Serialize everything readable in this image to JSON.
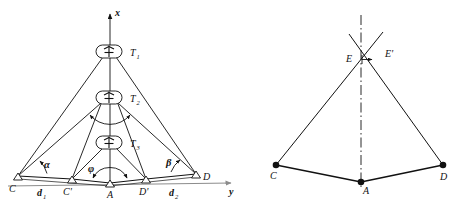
{
  "figure": {
    "colors": {
      "stroke": "#111111",
      "axis_gray": "#8c8c8c",
      "background": "#ffffff"
    }
  },
  "left_panel": {
    "axes": {
      "x_label": "x",
      "y_label": "y",
      "x_axis_color": "#111111",
      "y_axis_color": "#8c8c8c"
    },
    "stations": [
      {
        "id": "T1",
        "label": "T",
        "sub": "1",
        "icon": "antenna-tower-icon",
        "x": 108,
        "y": 52
      },
      {
        "id": "T2",
        "label": "T",
        "sub": "2",
        "icon": "antenna-tower-icon",
        "x": 108,
        "y": 98
      },
      {
        "id": "T3",
        "label": "T",
        "sub": "3",
        "icon": "antenna-tower-icon",
        "x": 108,
        "y": 143
      }
    ],
    "ground_points": [
      {
        "id": "C",
        "label": "C",
        "marker": "triangle-marker",
        "x": 18,
        "y": 176
      },
      {
        "id": "Cp",
        "label": "C'",
        "marker": "triangle-marker",
        "x": 72,
        "y": 179
      },
      {
        "id": "A",
        "label": "A",
        "marker": "triangle-marker",
        "x": 110,
        "y": 183
      },
      {
        "id": "Dp",
        "label": "D'",
        "marker": "triangle-marker",
        "x": 146,
        "y": 179
      },
      {
        "id": "D",
        "label": "D",
        "marker": "triangle-marker",
        "x": 196,
        "y": 174
      }
    ],
    "angles": [
      {
        "id": "alpha",
        "label": "α",
        "at": "C",
        "x": 44,
        "y": 166
      },
      {
        "id": "phi",
        "label": "φ",
        "at": "A",
        "x": 92,
        "y": 170
      },
      {
        "id": "beta",
        "label": "β",
        "at": "D",
        "x": 168,
        "y": 163
      }
    ],
    "distances": [
      {
        "id": "d1",
        "label": "d",
        "sub": "1",
        "from": "C",
        "to": "C'",
        "x": 40,
        "y": 192
      },
      {
        "id": "d2",
        "label": "d",
        "sub": "2",
        "from": "D'",
        "to": "D",
        "x": 172,
        "y": 192
      }
    ]
  },
  "right_panel": {
    "axis_label_y": "y",
    "center_line": "dash-dot-vertical-line",
    "points": [
      {
        "id": "C",
        "label": "C",
        "marker": "filled-dot",
        "x": 276,
        "y": 165
      },
      {
        "id": "A",
        "label": "A",
        "marker": "filled-dot",
        "x": 361,
        "y": 182
      },
      {
        "id": "D",
        "label": "D",
        "marker": "filled-dot",
        "x": 443,
        "y": 165
      },
      {
        "id": "E",
        "label": "E",
        "marker": "none",
        "x": 349,
        "y": 55
      },
      {
        "id": "Ep",
        "label": "E'",
        "marker": "none",
        "x": 388,
        "y": 52
      }
    ],
    "tick": "e-offset-tick"
  }
}
